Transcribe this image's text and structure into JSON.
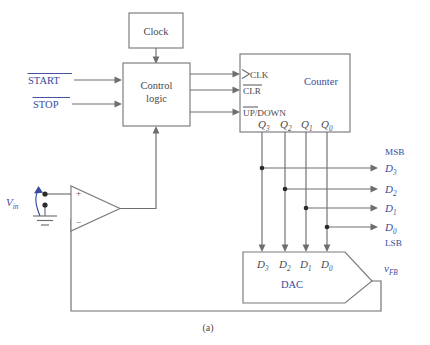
{
  "figure": {
    "caption": "(a)",
    "title_hidden": "",
    "colors": {
      "label_blue": "#3b4a9c",
      "label_dark": "#4a4a4e",
      "wire": "#6e6e72",
      "box_stroke": "#7a7a7f",
      "background": "#ffffff"
    }
  },
  "blocks": {
    "clock": {
      "label": "Clock"
    },
    "control_logic": {
      "label_line1": "Control",
      "label_line2": "logic"
    },
    "counter": {
      "label": "Counter",
      "inputs": [
        {
          "name": "clk",
          "label": "CLK",
          "overbar": false,
          "clock_triangle": true
        },
        {
          "name": "clr",
          "label": "CLR",
          "overbar": true,
          "clock_triangle": false
        },
        {
          "name": "up_down",
          "label_bar": "UP",
          "label_rest": "/DOWN",
          "overbar": true,
          "clock_triangle": false
        }
      ],
      "outputs": [
        {
          "base": "Q",
          "sub": "3"
        },
        {
          "base": "Q",
          "sub": "2"
        },
        {
          "base": "Q",
          "sub": "1"
        },
        {
          "base": "Q",
          "sub": "0"
        }
      ]
    },
    "dac": {
      "label": "DAC",
      "inputs": [
        {
          "base": "D",
          "sub": "3"
        },
        {
          "base": "D",
          "sub": "2"
        },
        {
          "base": "D",
          "sub": "1"
        },
        {
          "base": "D",
          "sub": "0"
        }
      ],
      "output": {
        "base": "v",
        "sub": "FB"
      }
    },
    "comparator": {
      "plus": "+",
      "minus": "−",
      "input_label": {
        "base": "V",
        "sub": "in"
      }
    }
  },
  "signals": {
    "start": {
      "label": "START",
      "overbar": true
    },
    "stop": {
      "label": "STOP",
      "overbar": true
    },
    "data_outputs": [
      {
        "base": "D",
        "sub": "3"
      },
      {
        "base": "D",
        "sub": "2"
      },
      {
        "base": "D",
        "sub": "1"
      },
      {
        "base": "D",
        "sub": "0"
      }
    ],
    "msb": "MSB",
    "lsb": "LSB"
  }
}
